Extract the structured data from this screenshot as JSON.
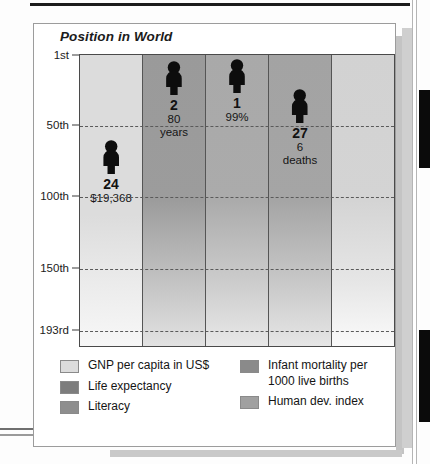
{
  "chart_data": {
    "type": "bar",
    "title": "Position in World",
    "xlabel": "",
    "ylabel": "Position in World",
    "ylim": [
      "1st",
      "193rd"
    ],
    "grid": true,
    "legend_position": "bottom",
    "y_ticks": [
      "1st",
      "50th",
      "100th",
      "150th",
      "193rd"
    ],
    "y_tick_values": [
      1,
      50,
      100,
      150,
      193
    ],
    "categories": [
      "GNP per capita in US$",
      "Life expectancy",
      "Literacy",
      "Infant mortality per 1000 live births",
      "Human dev. index"
    ],
    "values": [
      24,
      2,
      1,
      27,
      null
    ],
    "series": [
      {
        "name": "Position in World",
        "values": [
          24,
          2,
          1,
          27,
          null
        ]
      }
    ],
    "data_labels": [
      {
        "rank": "24",
        "metric": "$19,368"
      },
      {
        "rank": "2",
        "metric": "80 years"
      },
      {
        "rank": "1",
        "metric": "99%"
      },
      {
        "rank": "27",
        "metric": "6 deaths"
      },
      {
        "rank": "",
        "metric": ""
      }
    ]
  },
  "chart": {
    "title": "Position in World",
    "y_axis": {
      "ticks": [
        {
          "label": "1st",
          "value": 1
        },
        {
          "label": "50th",
          "value": 50
        },
        {
          "label": "100th",
          "value": 100
        },
        {
          "label": "150th",
          "value": 150
        },
        {
          "label": "193rd",
          "value": 193
        }
      ]
    },
    "columns": [
      {
        "key": "gnp",
        "name": "GNP per capita in US$",
        "rank": "24",
        "rank_value": 24,
        "metric_line1": "$19,368",
        "metric_line2": "",
        "color": "#dcdcdc"
      },
      {
        "key": "life",
        "name": "Life expectancy",
        "rank": "2",
        "rank_value": 2,
        "metric_line1": "80",
        "metric_line2": "years",
        "color": "#9a9a9a"
      },
      {
        "key": "literacy",
        "name": "Literacy",
        "rank": "1",
        "rank_value": 1,
        "metric_line1": "99%",
        "metric_line2": "",
        "color": "#a9a9a9"
      },
      {
        "key": "infant_mortality",
        "name": "Infant mortality per 1000 live births",
        "rank": "27",
        "rank_value": 27,
        "metric_line1": "6",
        "metric_line2": "deaths",
        "color": "#a3a3a3"
      },
      {
        "key": "hdi",
        "name": "Human dev. index",
        "rank": "",
        "rank_value": null,
        "metric_line1": "",
        "metric_line2": "",
        "color": "#d2d2d2"
      }
    ]
  },
  "legend": {
    "left": [
      {
        "label": "GNP per capita in US$",
        "color": "#dcdcdc"
      },
      {
        "label": "Life expectancy",
        "color": "#7d7d7d"
      },
      {
        "label": "Literacy",
        "color": "#8e8e8e"
      }
    ],
    "right": [
      {
        "label": "Infant mortality per 1000 live births",
        "color": "#8a8a8a"
      },
      {
        "label": "Human dev. index",
        "color": "#a0a0a0"
      }
    ]
  }
}
